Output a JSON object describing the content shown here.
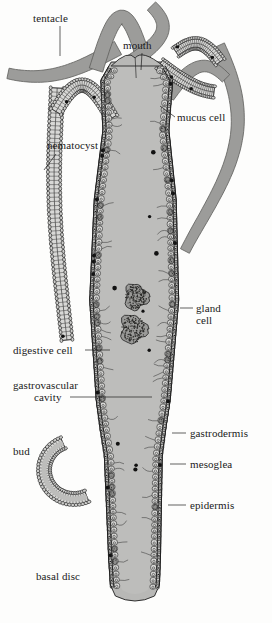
{
  "figure": {
    "style": "grayscale line drawing",
    "colors": {
      "body_fill": "#b8b8b6",
      "cavity_fill": "#bdbdbb",
      "tentacle_fill": "#9c9c9a",
      "cell_fill": "#d8d8d6",
      "ink": "#1d1d1d",
      "background": "#fdfdfc",
      "food_mass": "#6e6e6c"
    }
  },
  "labels": [
    {
      "id": "tentacle",
      "text": "tentacle",
      "x": 33,
      "y": 13,
      "align": "left",
      "leader": "vertical"
    },
    {
      "id": "mouth",
      "text": "mouth",
      "x": 123,
      "y": 40,
      "align": "left",
      "leader": "vertical"
    },
    {
      "id": "mucus-cell",
      "text": "mucus cell",
      "x": 177,
      "y": 112,
      "align": "left",
      "leader": "diagonal"
    },
    {
      "id": "nematocyst",
      "text": "nematocyst",
      "x": 47,
      "y": 140,
      "align": "left",
      "leader": "diagonal"
    },
    {
      "id": "gland-cell-line1",
      "text": "gland",
      "x": 196,
      "y": 303,
      "align": "left",
      "leader": "dash"
    },
    {
      "id": "gland-cell-line2",
      "text": "cell",
      "x": 196,
      "y": 315,
      "align": "left",
      "leader": "none"
    },
    {
      "id": "digestive-cell",
      "text": "digestive cell",
      "x": 13,
      "y": 345,
      "align": "left",
      "leader": "horizontal"
    },
    {
      "id": "gastrovascular-l1",
      "text": "gastrovascular",
      "x": 13,
      "y": 380,
      "align": "left",
      "leader": "none"
    },
    {
      "id": "gastrovascular-l2",
      "text": "cavity",
      "x": 34,
      "y": 392,
      "align": "left",
      "leader": "horizontal"
    },
    {
      "id": "bud",
      "text": "bud",
      "x": 13,
      "y": 446,
      "align": "left",
      "leader": "none"
    },
    {
      "id": "gastrodermis",
      "text": "gastrodermis",
      "x": 190,
      "y": 428,
      "align": "left",
      "leader": "dash"
    },
    {
      "id": "mesoglea",
      "text": "mesoglea",
      "x": 190,
      "y": 459,
      "align": "left",
      "leader": "dash"
    },
    {
      "id": "epidermis",
      "text": "epidermis",
      "x": 190,
      "y": 500,
      "align": "left",
      "leader": "dash"
    },
    {
      "id": "basal-disc",
      "text": "basal disc",
      "x": 36,
      "y": 571,
      "align": "left",
      "leader": "none"
    }
  ],
  "structures": [
    {
      "id": "tentacle-left",
      "name": "left tentacle"
    },
    {
      "id": "tentacle-right",
      "name": "right tentacle"
    },
    {
      "id": "hypostome",
      "name": "hypostome and mouth"
    },
    {
      "id": "body-column",
      "name": "body column"
    },
    {
      "id": "gastrovascular-cavity",
      "name": "gastrovascular cavity"
    },
    {
      "id": "food-mass",
      "name": "ingested food mass"
    },
    {
      "id": "bud-structure",
      "name": "bud"
    },
    {
      "id": "basal-disc-structure",
      "name": "basal disc"
    }
  ]
}
